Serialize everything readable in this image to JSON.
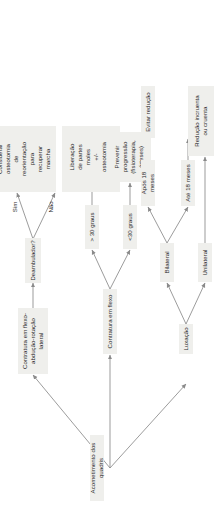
{
  "diagram": {
    "title": "Acometimento dos quadris",
    "orientation": "rotated-90-ccw",
    "colors": {
      "node_background": "#efefec",
      "text": "#2b2b2b",
      "edge": "#8a8a8a",
      "canvas": "#ffffff"
    },
    "nodes": {
      "root": "Acometimento dos quadris",
      "contratura_flexo_abducao": "Contratura em flexo-\nabdução-rotação lateral",
      "deambulador": "Deambulador?",
      "considerar_osteotomia": "Considerar\nosteotomia\nde\nreorientação\npara\nrecuperar\nmarcha",
      "cirurgias_partes_moles": "Cirurgias de\npartes moles/\nóssea visando\na melhor\nacomodação e\nhigiene",
      "contratura_flexo": "Contratura em flexo",
      "menor_30_graus": "<30 graus",
      "maior_30_graus": "> 30 graus",
      "prevenir_progressao": "Prevenir\nprogressão\n(fisioterapia,\nórteses)",
      "liberacao_partes_moles": "Liberação\nde partes\nmoles\n+/-\nosteotomia\nextensora",
      "luxacao": "Luxação",
      "unilateral": "Unilateral",
      "bilateral": "Bilateral",
      "ate_18_meses": "Até 18 meses",
      "apos_18_meses": "Após 18 meses",
      "reducao_incruenta": "Redução incruenta\nou cruenta",
      "evitar_reducao": "Evitar redução"
    },
    "edge_labels": {
      "sim": "Sim",
      "nao": "Não"
    }
  }
}
